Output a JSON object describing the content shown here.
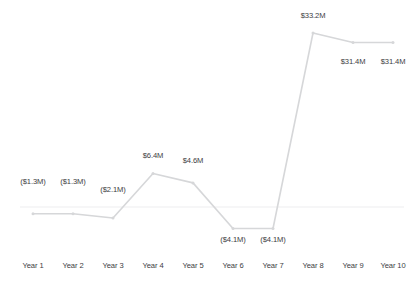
{
  "chart_data": {
    "type": "line",
    "title": "",
    "xlabel": "",
    "ylabel": "",
    "categories": [
      "Year 1",
      "Year 2",
      "Year 3",
      "Year 4",
      "Year 5",
      "Year 6",
      "Year 7",
      "Year 8",
      "Year 9",
      "Year 10"
    ],
    "values": [
      -1.3,
      -1.3,
      -2.1,
      6.4,
      4.6,
      -4.1,
      -4.1,
      33.2,
      31.4,
      31.4
    ],
    "point_labels": [
      "($1.3M)",
      "($1.3M)",
      "($2.1M)",
      "$6.4M",
      "$4.6M",
      "($4.1M)",
      "($4.1M)",
      "$33.2M",
      "$31.4M",
      "$31.4M"
    ],
    "units": "$M",
    "ylim": [
      -6,
      36
    ],
    "grid": false,
    "legend": false,
    "zero_line": 0,
    "series": [
      {
        "name": "Value",
        "values": [
          -1.3,
          -1.3,
          -2.1,
          6.4,
          4.6,
          -4.1,
          -4.1,
          33.2,
          31.4,
          31.4
        ]
      }
    ],
    "colors": {
      "line": "#d6d7d9",
      "marker": "#d6d7d9",
      "zero_line": "#ededef",
      "label_text": "#3d3d3f",
      "background": "#ffffff"
    }
  }
}
